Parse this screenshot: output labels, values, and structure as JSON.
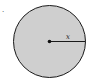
{
  "figure": {
    "label_mark": ".",
    "radius_label": "x",
    "colors": {
      "fill": "#cfcfcf",
      "stroke": "#1a1a1a",
      "background": "#ffffff"
    }
  }
}
